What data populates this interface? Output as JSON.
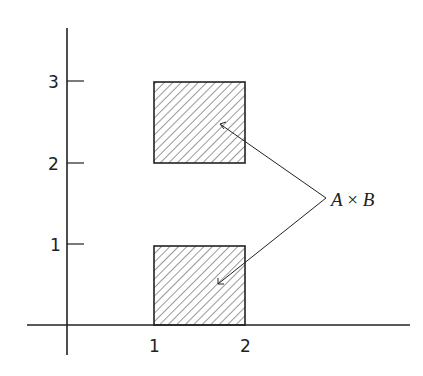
{
  "diagram": {
    "title": "",
    "axes": {
      "x_ticks": [
        {
          "label": "1",
          "value": 1
        },
        {
          "label": "2",
          "value": 2
        }
      ],
      "y_ticks": [
        {
          "label": "1",
          "value": 1
        },
        {
          "label": "2",
          "value": 2
        },
        {
          "label": "3",
          "value": 3
        }
      ]
    },
    "regions": [
      {
        "name": "upper-square",
        "x": [
          1,
          2
        ],
        "y": [
          2,
          3
        ],
        "fill": "hatched"
      },
      {
        "name": "lower-square",
        "x": [
          1,
          2
        ],
        "y": [
          0,
          1
        ],
        "fill": "hatched"
      }
    ],
    "annotation": {
      "label_a": "A",
      "times": " × ",
      "label_b": "B",
      "points_to": [
        "upper-square",
        "lower-square"
      ]
    },
    "colors": {
      "ink": "#222222",
      "background": "#ffffff"
    }
  }
}
